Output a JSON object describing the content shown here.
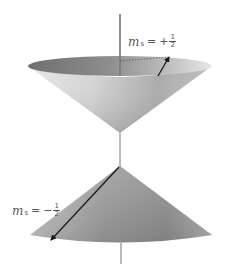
{
  "diagram": {
    "axis_color": "#777777",
    "cone_colors": {
      "rim_inner_dark": "#7a7a7a",
      "rim_inner_light": "#c8c8c8",
      "body_light": "#e2e2e2",
      "body_dark": "#8a8a8a",
      "arrow": "#1a1a1a"
    },
    "upper_cone": {
      "name": "spin-up cone",
      "label": {
        "symbol": "m",
        "subscript": "s",
        "equals": "=",
        "sign": "+",
        "numerator": "1",
        "denominator": "2"
      }
    },
    "lower_cone": {
      "name": "spin-down cone",
      "label": {
        "symbol": "m",
        "subscript": "s",
        "equals": "=",
        "sign": "−",
        "numerator": "1",
        "denominator": "2"
      }
    }
  }
}
